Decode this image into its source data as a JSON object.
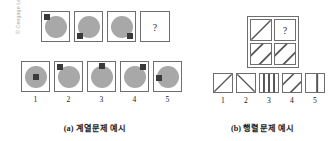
{
  "figure": {
    "copyright": "© Cengage Learning",
    "background_color": "#ffffff",
    "circle_color": "#a8a8a8",
    "square_color": "#3a3a3a",
    "border_color": "#6e6e6e",
    "stripe_color": "#555555"
  },
  "panel_a": {
    "caption": "(a) 계열문제 예시",
    "question_mark": "?",
    "stem": {
      "name": "series-stem",
      "cells": [
        {
          "square_position": "top-left",
          "has_circle": true,
          "is_question": false
        },
        {
          "square_position": "bottom-left",
          "has_circle": true,
          "is_question": false
        },
        {
          "square_position": "bottom-right",
          "has_circle": true,
          "is_question": false
        },
        {
          "square_position": "none",
          "has_circle": false,
          "is_question": true
        }
      ]
    },
    "options": {
      "name": "series-options",
      "labels": [
        "1",
        "2",
        "3",
        "4",
        "5"
      ],
      "cells": [
        {
          "square_position": "center",
          "has_circle": true
        },
        {
          "square_position": "top-left",
          "has_circle": true
        },
        {
          "square_position": "top-center",
          "has_circle": true
        },
        {
          "square_position": "top-right",
          "has_circle": true
        },
        {
          "square_position": "mid-left",
          "has_circle": true
        }
      ]
    }
  },
  "panel_b": {
    "caption": "(b) 행렬문제 예시",
    "question_mark": "?",
    "matrix": {
      "name": "matrix-stem",
      "cells": [
        {
          "pattern": "diagonal-up-single",
          "is_question": false
        },
        {
          "pattern": "none",
          "is_question": true
        },
        {
          "pattern": "diagonal-up-double",
          "is_question": false
        },
        {
          "pattern": "diagonal-up-double",
          "is_question": false
        }
      ]
    },
    "options": {
      "name": "matrix-options",
      "labels": [
        "1",
        "2",
        "3",
        "4",
        "5"
      ],
      "cells": [
        {
          "pattern": "diagonal-up-single"
        },
        {
          "pattern": "diagonal-down-single"
        },
        {
          "pattern": "vertical-triple"
        },
        {
          "pattern": "diagonal-up-double"
        },
        {
          "pattern": "vertical-single"
        }
      ]
    }
  }
}
